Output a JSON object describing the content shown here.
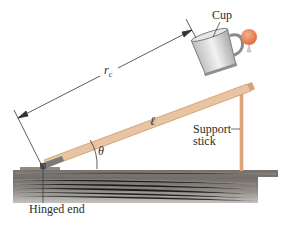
{
  "diagram": {
    "labels": {
      "cup": "Cup",
      "rc_symbol": "r",
      "rc_subscript": "c",
      "board_length": "ℓ",
      "angle": "θ",
      "support_line1": "Support",
      "support_line2": "stick",
      "hinged_end": "Hinged end"
    },
    "colors": {
      "board": "#e8c4a0",
      "board_edge": "#c99a70",
      "support_stick": "#e0a882",
      "ball": "#e8875a",
      "table_top": "#7d7872",
      "table_body": "#a9a6a2",
      "cup_body": "#d9d9d9",
      "dimension_line": "#333333"
    },
    "components": [
      "inclined board",
      "cup",
      "ball",
      "support stick",
      "hinge",
      "table",
      "dimension line r_c",
      "angle arc θ"
    ]
  }
}
